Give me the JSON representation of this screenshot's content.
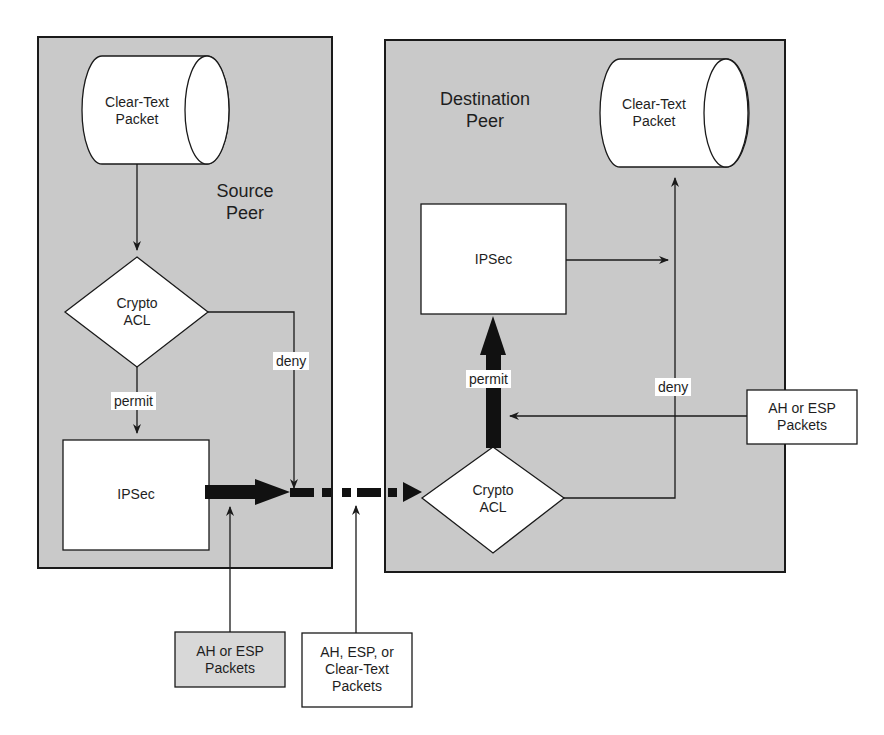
{
  "diagram": {
    "source_peer": {
      "title_line1": "Source",
      "title_line2": "Peer",
      "cylinder_line1": "Clear-Text",
      "cylinder_line2": "Packet",
      "acl_line1": "Crypto",
      "acl_line2": "ACL",
      "ipsec": "IPSec",
      "permit": "permit",
      "deny": "deny"
    },
    "destination_peer": {
      "title_line1": "Destination",
      "title_line2": "Peer",
      "cylinder_line1": "Clear-Text",
      "cylinder_line2": "Packet",
      "acl_line1": "Crypto",
      "acl_line2": "ACL",
      "ipsec": "IPSec",
      "permit": "permit",
      "deny": "deny"
    },
    "callouts": {
      "source_out_line1": "AH or ESP",
      "source_out_line2": "Packets",
      "transit_line1": "AH, ESP, or",
      "transit_line2": "Clear-Text",
      "transit_line3": "Packets",
      "dest_in_line1": "AH or ESP",
      "dest_in_line2": "Packets"
    },
    "colors": {
      "panel_fill": "#c9c9c9",
      "shape_fill": "#ffffff",
      "stroke": "#1a1a1a",
      "callout_fill_shaded": "#d8d8d8"
    }
  }
}
